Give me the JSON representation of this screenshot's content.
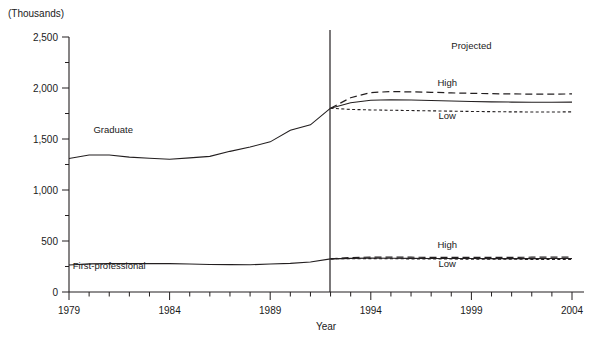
{
  "chart_title": "",
  "unit_note": "(Thousands)",
  "projected_note": "Projected",
  "axis": {
    "x_title": "Year",
    "x_ticks": [
      "1979",
      "1984",
      "1989",
      "1994",
      "1999",
      "2004"
    ],
    "y_ticks": [
      "0",
      "500",
      "1,000",
      "1,500",
      "2,000",
      "2,500"
    ]
  },
  "series_labels": {
    "graduate": "Graduate",
    "first_professional": "First-professional",
    "high_upper": "High",
    "low_upper": "Low",
    "high_lower": "High",
    "low_lower": "Low"
  },
  "colors": {
    "ink": "#231f20",
    "background": "#ffffff"
  },
  "chart_data": {
    "type": "line",
    "title": "",
    "subtitle": "(Thousands)",
    "xlabel": "Year",
    "ylabel": "(Thousands)",
    "xlim": [
      1979,
      2004
    ],
    "ylim": [
      0,
      2500
    ],
    "y_major_step": 500,
    "y_minor_step": 250,
    "x_tick_step": 1,
    "x_label_step": 5,
    "grid": false,
    "legend": "inline-annotations",
    "projection_start_year": 1992,
    "annotations": [
      {
        "text": "Projected",
        "x": 1999.0,
        "y": 2380
      },
      {
        "text": "Graduate",
        "x": 1981.2,
        "y": 1560
      },
      {
        "text": "First-professional",
        "x": 1981.0,
        "y": 230
      },
      {
        "text": "High",
        "x": 1997.8,
        "y": 2020
      },
      {
        "text": "Low",
        "x": 1997.8,
        "y": 1700
      },
      {
        "text": "High",
        "x": 1997.8,
        "y": 430
      },
      {
        "text": "Low",
        "x": 1997.8,
        "y": 250
      }
    ],
    "series": [
      {
        "name": "Graduate (actual)",
        "style": "solid",
        "x": [
          1979,
          1980,
          1981,
          1982,
          1983,
          1984,
          1985,
          1986,
          1987,
          1988,
          1989,
          1990,
          1991,
          1992
        ],
        "values": [
          1309,
          1343,
          1343,
          1322,
          1312,
          1302,
          1315,
          1330,
          1379,
          1422,
          1472,
          1586,
          1639,
          1802
        ]
      },
      {
        "name": "Graduate (middle projection)",
        "style": "solid",
        "x": [
          1992,
          1993,
          1994,
          1995,
          1996,
          1997,
          1998,
          1999,
          2000,
          2001,
          2002,
          2003,
          2004
        ],
        "values": [
          1802,
          1855,
          1880,
          1885,
          1882,
          1878,
          1872,
          1868,
          1864,
          1862,
          1860,
          1860,
          1862
        ]
      },
      {
        "name": "Graduate (high projection)",
        "style": "long-dash",
        "x": [
          1992,
          1993,
          1994,
          1995,
          1996,
          1997,
          1998,
          1999,
          2000,
          2001,
          2002,
          2003,
          2004
        ],
        "values": [
          1802,
          1905,
          1955,
          1965,
          1962,
          1958,
          1952,
          1948,
          1944,
          1942,
          1940,
          1940,
          1942
        ]
      },
      {
        "name": "Graduate (low projection)",
        "style": "short-dash",
        "x": [
          1992,
          1993,
          1994,
          1995,
          1996,
          1997,
          1998,
          1999,
          2000,
          2001,
          2002,
          2003,
          2004
        ],
        "values": [
          1802,
          1790,
          1785,
          1782,
          1779,
          1776,
          1773,
          1770,
          1768,
          1766,
          1765,
          1765,
          1766
        ]
      },
      {
        "name": "First-professional (actual)",
        "style": "solid",
        "x": [
          1979,
          1980,
          1981,
          1982,
          1983,
          1984,
          1985,
          1986,
          1987,
          1988,
          1989,
          1990,
          1991,
          1992
        ],
        "values": [
          264,
          276,
          278,
          278,
          278,
          278,
          274,
          270,
          268,
          267,
          274,
          281,
          294,
          325
        ]
      },
      {
        "name": "First-professional (middle projection)",
        "style": "solid",
        "x": [
          1992,
          1993,
          1994,
          1995,
          1996,
          1997,
          1998,
          1999,
          2000,
          2001,
          2002,
          2003,
          2004
        ],
        "values": [
          325,
          330,
          332,
          331,
          330,
          329,
          328,
          328,
          327,
          327,
          327,
          328,
          328
        ]
      },
      {
        "name": "First-professional (high projection)",
        "style": "long-dash",
        "x": [
          1992,
          1993,
          1994,
          1995,
          1996,
          1997,
          1998,
          1999,
          2000,
          2001,
          2002,
          2003,
          2004
        ],
        "values": [
          325,
          338,
          342,
          342,
          341,
          340,
          340,
          340,
          340,
          340,
          341,
          342,
          343
        ]
      },
      {
        "name": "First-professional (low projection)",
        "style": "short-dash",
        "x": [
          1992,
          1993,
          1994,
          1995,
          1996,
          1997,
          1998,
          1999,
          2000,
          2001,
          2002,
          2003,
          2004
        ],
        "values": [
          325,
          326,
          327,
          326,
          325,
          324,
          323,
          322,
          321,
          321,
          320,
          320,
          320
        ]
      }
    ]
  }
}
